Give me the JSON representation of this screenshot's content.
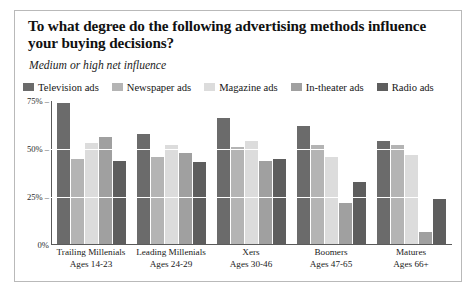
{
  "chart": {
    "title": "To what degree do the following advertising methods influence your buying decisions?",
    "subtitle": "Medium or high net influence"
  },
  "chart_data": {
    "type": "bar",
    "title": "To what degree do the following advertising methods influence your buying decisions?",
    "subtitle": "Medium or high net influence",
    "xlabel": "",
    "ylabel": "",
    "ylim": [
      0,
      75
    ],
    "grid": true,
    "legend_position": "top",
    "ytick_labels": [
      "75%",
      "50%",
      "25%",
      "0%"
    ],
    "ytick_values": [
      75,
      50,
      25,
      0
    ],
    "categories": [
      "Trailing Millenials",
      "Leading Millenials",
      "Xers",
      "Boomers",
      "Matures"
    ],
    "category_sublabels": [
      "Ages 14-23",
      "Ages 24-29",
      "Ages 30-46",
      "Ages 47-65",
      "Ages 66+"
    ],
    "series": [
      {
        "name": "Television ads",
        "color": "#6b6b6b",
        "values": [
          74,
          58,
          66,
          62,
          54
        ]
      },
      {
        "name": "Newspaper ads",
        "color": "#b4b4b4",
        "values": [
          45,
          46,
          51,
          52,
          52
        ]
      },
      {
        "name": "Magazine ads",
        "color": "#dcdcdc",
        "values": [
          53,
          52,
          54,
          46,
          47
        ]
      },
      {
        "name": "In-theater ads",
        "color": "#a0a0a0",
        "values": [
          56,
          48,
          44,
          22,
          7
        ]
      },
      {
        "name": "Radio ads",
        "color": "#5e5e5e",
        "values": [
          44,
          43,
          45,
          33,
          24
        ]
      }
    ]
  }
}
